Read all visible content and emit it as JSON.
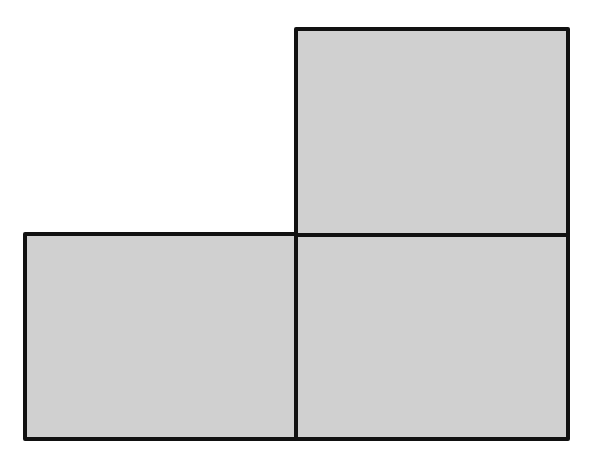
{
  "diagram": {
    "canvas": {
      "width": 597,
      "height": 466,
      "background": "#ffffff"
    },
    "style": {
      "fill": "#d0d0d0",
      "stroke": "#111111",
      "stroke_width": 4
    },
    "shapes": [
      {
        "id": "top-right-rect",
        "x": 296,
        "y": 29,
        "width": 272,
        "height": 206
      },
      {
        "id": "bottom-left-rect",
        "x": 25,
        "y": 234,
        "width": 271,
        "height": 205
      },
      {
        "id": "bottom-right-rect",
        "x": 296,
        "y": 235,
        "width": 272,
        "height": 204
      }
    ]
  }
}
